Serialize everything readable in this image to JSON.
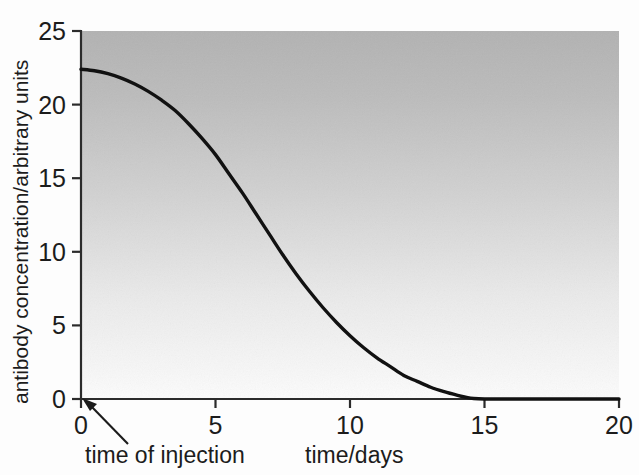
{
  "figure": {
    "background_color": "#fdfdfd",
    "plot_top_color": "#b4b4b4",
    "plot_bottom_color": "#fbfbfb",
    "curve_color": "#111111",
    "axis_color": "#2b2b2b"
  },
  "chart_data": {
    "type": "line",
    "title": "",
    "xlabel": "time/days",
    "ylabel": "antibody concentration/arbitrary units",
    "xlim": [
      0,
      20
    ],
    "ylim": [
      0,
      25
    ],
    "xticks": [
      0,
      5,
      10,
      15,
      20
    ],
    "yticks": [
      0,
      5,
      10,
      15,
      20,
      25
    ],
    "xtick_labels": [
      "0",
      "5",
      "10",
      "15",
      "20"
    ],
    "ytick_labels": [
      "0",
      "5",
      "10",
      "15",
      "20",
      "25"
    ],
    "grid": false,
    "legend": "none",
    "series": [
      {
        "name": "antibody concentration",
        "x": [
          0,
          0.5,
          1,
          1.5,
          2,
          2.5,
          3,
          3.5,
          4,
          4.5,
          5,
          5.5,
          6,
          6.5,
          7,
          7.5,
          8,
          8.5,
          9,
          9.5,
          10,
          10.5,
          11,
          11.5,
          12,
          12.5,
          13,
          13.5,
          14,
          14.3,
          14.6,
          15,
          16,
          17,
          18,
          19,
          20
        ],
        "y": [
          22.4,
          22.3,
          22.1,
          21.8,
          21.4,
          20.9,
          20.3,
          19.6,
          18.7,
          17.7,
          16.6,
          15.3,
          14.0,
          12.6,
          11.2,
          9.8,
          8.5,
          7.3,
          6.2,
          5.2,
          4.3,
          3.5,
          2.8,
          2.2,
          1.6,
          1.2,
          0.8,
          0.5,
          0.25,
          0.12,
          0.03,
          0,
          0,
          0,
          0,
          0,
          0
        ]
      }
    ],
    "annotations": [
      {
        "name": "time-of-injection",
        "text": "time of injection",
        "points_to_x": 0,
        "points_to_y": 0
      }
    ]
  },
  "labels": {
    "y_axis_title": "antibody concentration/arbitrary units",
    "x_axis_title": "time/days",
    "injection_annotation": "time of injection"
  }
}
